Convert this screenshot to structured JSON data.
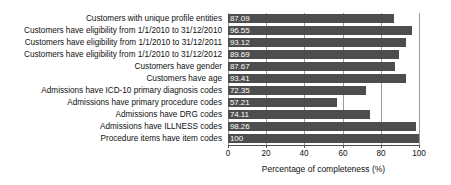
{
  "chart_data": {
    "type": "bar",
    "orientation": "horizontal",
    "title": "",
    "xlabel": "Percentage of completeness (%)",
    "ylabel": "",
    "xlim": [
      0,
      100
    ],
    "xticks": [
      0,
      20,
      40,
      60,
      80,
      100
    ],
    "xtick_labels": [
      "0",
      "20",
      "40",
      "60",
      "80",
      "100"
    ],
    "grid": true,
    "grid_axis": "x",
    "legend": false,
    "bar_color": "#4d4d4d",
    "value_label_color": "#ffffff",
    "categories": [
      "Customers with unique profile entities",
      "Customers have eligibility from 1/1/2010 to 31/12/2010",
      "Customers have eligibility from 1/1/2010 to 31/12/2011",
      "Customers have eligibility from 1/1/2010 to 31/12/2012",
      "Customers have gender",
      "Customers have age",
      "Admissions have ICD-10 primary diagnosis codes",
      "Admissions have primary procedure codes",
      "Admissions have DRG codes",
      "Admissions have ILLNESS codes",
      "Procedure items have item codes"
    ],
    "values": [
      87.09,
      96.55,
      93.12,
      89.69,
      87.67,
      93.41,
      72.35,
      57.21,
      74.11,
      98.26,
      100
    ],
    "value_labels": [
      "87.09",
      "96.55",
      "93.12",
      "89.69",
      "87.67",
      "93.41",
      "72.35",
      "57.21",
      "74.11",
      "98.26",
      "100"
    ]
  }
}
